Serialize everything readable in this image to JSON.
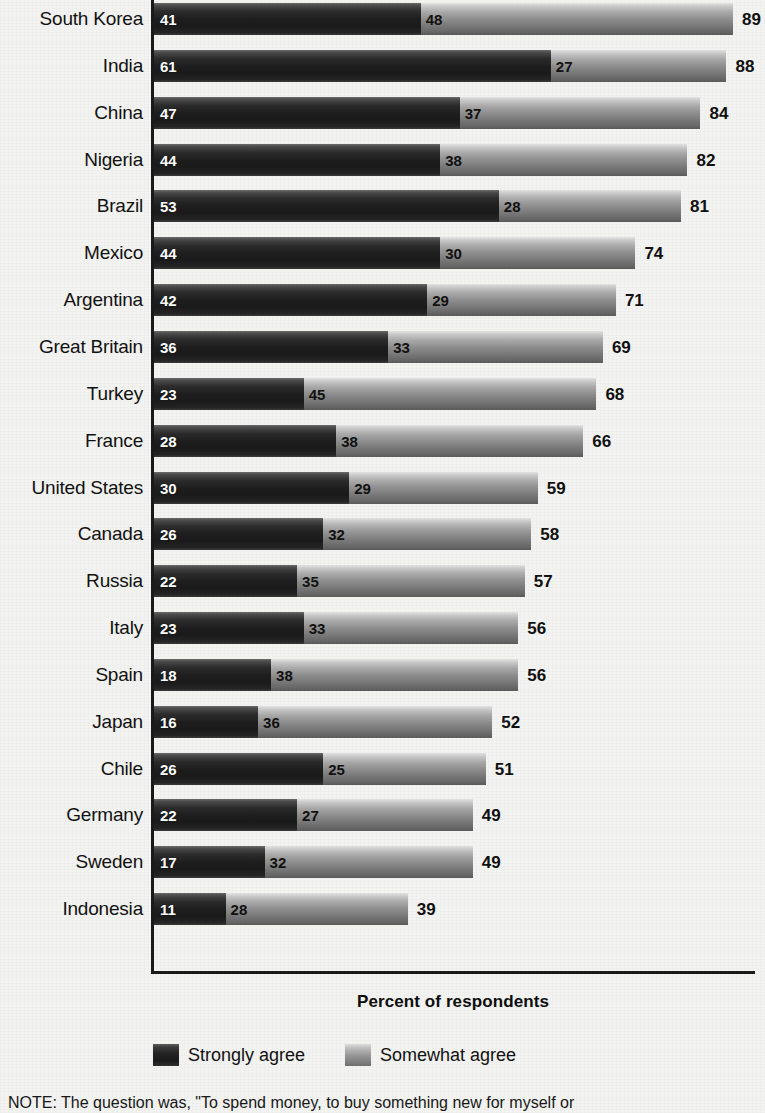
{
  "chart_data": {
    "type": "bar",
    "orientation": "horizontal",
    "stacked": true,
    "title": "",
    "xlabel": "Percent of respondents",
    "ylabel": "",
    "xlim": [
      0,
      89
    ],
    "grid": false,
    "legend_position": "bottom",
    "categories": [
      "South Korea",
      "India",
      "China",
      "Nigeria",
      "Brazil",
      "Mexico",
      "Argentina",
      "Great Britain",
      "Turkey",
      "France",
      "United States",
      "Canada",
      "Russia",
      "Italy",
      "Spain",
      "Japan",
      "Chile",
      "Germany",
      "Sweden",
      "Indonesia"
    ],
    "series": [
      {
        "name": "Strongly agree",
        "color": "#1f1f1f",
        "values": [
          41,
          61,
          47,
          44,
          53,
          44,
          42,
          36,
          23,
          28,
          30,
          26,
          22,
          23,
          18,
          16,
          26,
          22,
          17,
          11
        ]
      },
      {
        "name": "Somewhat agree",
        "color": "#909090",
        "values": [
          48,
          27,
          37,
          38,
          28,
          30,
          29,
          33,
          45,
          38,
          29,
          32,
          35,
          33,
          38,
          36,
          25,
          27,
          32,
          28
        ]
      }
    ],
    "totals": [
      89,
      88,
      84,
      82,
      81,
      74,
      71,
      69,
      68,
      66,
      59,
      58,
      57,
      56,
      56,
      52,
      51,
      49,
      49,
      39
    ]
  },
  "axis": {
    "x_title": "Percent of respondents"
  },
  "legend": {
    "items": [
      {
        "label": "Strongly agree",
        "swatch": "strong"
      },
      {
        "label": "Somewhat agree",
        "swatch": "somewhat"
      }
    ]
  },
  "note": {
    "text": "NOTE: The question was, \"To spend money, to buy something new for myself or"
  }
}
